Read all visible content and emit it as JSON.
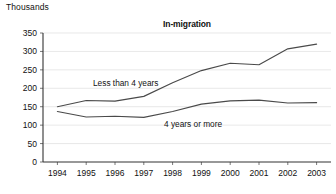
{
  "units_caption": "Thousands",
  "chart_data": {
    "type": "line",
    "title": "In-migration",
    "xlabel": "",
    "ylabel": "Thousands",
    "categories": [
      "1994",
      "1995",
      "1996",
      "1997",
      "1998",
      "1999",
      "2000",
      "2001",
      "2002",
      "2003"
    ],
    "x": [
      1994,
      1995,
      1996,
      1997,
      1998,
      1999,
      2000,
      2001,
      2002,
      2003
    ],
    "ylim": [
      0,
      350
    ],
    "yticks": [
      0,
      50,
      100,
      150,
      200,
      250,
      300,
      350
    ],
    "ytick_labels": [
      "0",
      "50",
      "100",
      "150",
      "200",
      "250",
      "300",
      "350"
    ],
    "grid": true,
    "legend": "inline-annotations",
    "series": [
      {
        "name": "Less than 4 years",
        "values": [
          150,
          167,
          165,
          178,
          215,
          248,
          268,
          264,
          307,
          320
        ],
        "color": "#4a4a4a",
        "annotation": "Less than 4 years"
      },
      {
        "name": "4 years or more",
        "values": [
          137,
          122,
          124,
          121,
          137,
          157,
          166,
          168,
          160,
          161
        ],
        "color": "#4a4a4a",
        "annotation": "4 years or more"
      }
    ]
  }
}
